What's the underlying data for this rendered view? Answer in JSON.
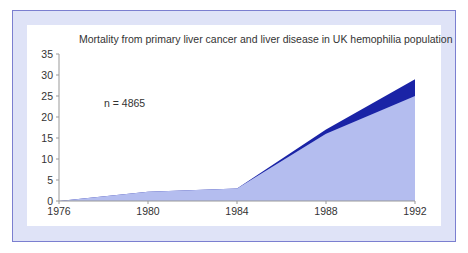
{
  "chart_data": {
    "type": "area",
    "title": "Mortality from primary liver cancer and liver disease in UK hemophilia population",
    "xlabel": "",
    "ylabel": "",
    "x": [
      1976,
      1980,
      1984,
      1988,
      1992
    ],
    "series": [
      {
        "name": "Lower (light) area",
        "color": "#b4bdef",
        "values": [
          0,
          2.2,
          3,
          16,
          25
        ]
      },
      {
        "name": "Upper (dark) area total",
        "color": "#1a23a6",
        "values": [
          0,
          2.2,
          3,
          17,
          29
        ]
      }
    ],
    "xticks": [
      "1976",
      "1980",
      "1984",
      "1988",
      "1992"
    ],
    "yticks": [
      "0",
      "5",
      "10",
      "15",
      "20",
      "25",
      "30",
      "35"
    ],
    "ylim": [
      0,
      35
    ],
    "xlim": [
      1976,
      1992
    ],
    "grid": false,
    "legend": null,
    "annotations": [
      "n = 4865"
    ]
  },
  "annotation": "n = 4865",
  "colors": {
    "frame_border": "#7b7fd0",
    "frame_fill": "#dfe3f7",
    "area_light": "#b4bdef",
    "area_dark": "#1a23a6"
  }
}
